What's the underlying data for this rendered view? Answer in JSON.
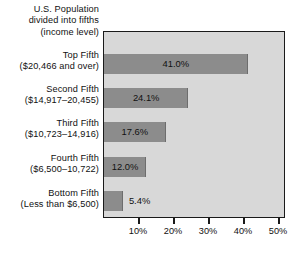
{
  "chart_data": {
    "type": "bar",
    "orientation": "horizontal",
    "title": "U.S. Population divided into fifths (income level)",
    "title_lines": [
      "U.S. Population",
      "divided into fifths",
      "(income level)"
    ],
    "xlabel": "",
    "ylabel": "",
    "xlim": [
      0,
      52
    ],
    "xticks": [
      10,
      20,
      30,
      40,
      50
    ],
    "xtick_labels": [
      "10%",
      "20%",
      "30%",
      "40%",
      "50%"
    ],
    "grid": false,
    "legend": "none",
    "categories": [
      "Top Fifth ($20,466 and over)",
      "Second Fifth ($14,917–20,455)",
      "Third Fifth ($10,723–14,916)",
      "Fourth Fifth ($6,500–10,722)",
      "Bottom Fifth (Less than $6,500)"
    ],
    "values": [
      41.0,
      24.1,
      17.6,
      12.0,
      5.4
    ],
    "bars": [
      {
        "name": "Top Fifth",
        "range": "($20,466 and over)",
        "value": 41.0,
        "value_label": "41.0%",
        "label_inside": true
      },
      {
        "name": "Second Fifth",
        "range": "($14,917–20,455)",
        "value": 24.1,
        "value_label": "24.1%",
        "label_inside": true
      },
      {
        "name": "Third Fifth",
        "range": "($10,723–14,916)",
        "value": 17.6,
        "value_label": "17.6%",
        "label_inside": true
      },
      {
        "name": "Fourth Fifth",
        "range": "($6,500–10,722)",
        "value": 12.0,
        "value_label": "12.0%",
        "label_inside": true
      },
      {
        "name": "Bottom Fifth",
        "range": "(Less than $6,500)",
        "value": 5.4,
        "value_label": "5.4%",
        "label_inside": false
      }
    ],
    "colors": {
      "bar_fill": "#8c8c8c",
      "plot_background": "#d8d8d8",
      "axis": "#1a1a1a",
      "text": "#111111",
      "page_background": "#ffffff"
    }
  }
}
